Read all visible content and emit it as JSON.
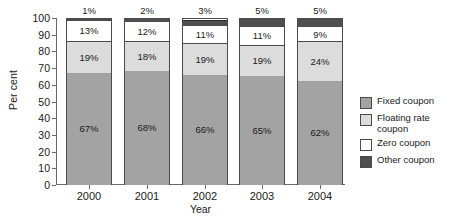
{
  "chart_data": {
    "type": "bar",
    "stacked": true,
    "title": "",
    "xlabel": "Year",
    "ylabel": "Per cent",
    "categories": [
      "2000",
      "2001",
      "2002",
      "2003",
      "2004"
    ],
    "ylim": [
      0,
      100
    ],
    "yticks": [
      0,
      10,
      20,
      30,
      40,
      50,
      60,
      70,
      80,
      90,
      100
    ],
    "ytick_labels": [
      "0",
      "10",
      "20",
      "30",
      "40",
      "50",
      "60",
      "70",
      "80",
      "90",
      "100"
    ],
    "grid": false,
    "legend_position": "right",
    "series": [
      {
        "name": "Fixed coupon",
        "color": "#a3a3a3",
        "values": [
          67,
          68,
          66,
          65,
          62
        ],
        "labels": [
          "67%",
          "68%",
          "66%",
          "65%",
          "62%"
        ]
      },
      {
        "name": "Floating rate coupon",
        "color": "#dcdcdc",
        "values": [
          19,
          18,
          19,
          19,
          24
        ],
        "labels": [
          "19%",
          "18%",
          "19%",
          "19%",
          "24%"
        ]
      },
      {
        "name": "Zero coupon",
        "color": "#ffffff",
        "values": [
          13,
          12,
          11,
          11,
          9
        ],
        "labels": [
          "13%",
          "12%",
          "11%",
          "11%",
          "9%"
        ]
      },
      {
        "name": "Other coupon",
        "color": "#4f4f4f",
        "values": [
          1,
          2,
          3,
          5,
          5
        ],
        "labels": [
          "1%",
          "2%",
          "3%",
          "5%",
          "5%"
        ]
      }
    ],
    "bar_top_labels": [
      "1%",
      "2%",
      "3%",
      "5%",
      "5%"
    ]
  },
  "axes": {
    "y_title": "Per cent",
    "x_title": "Year"
  },
  "legend": {
    "items": [
      {
        "label": "Fixed coupon",
        "color": "#a3a3a3",
        "swatch": "sw-fixed"
      },
      {
        "label": "Floating rate\ncoupon",
        "color": "#dcdcdc",
        "swatch": "sw-floating"
      },
      {
        "label": "Zero coupon",
        "color": "#ffffff",
        "swatch": "sw-zero"
      },
      {
        "label": "Other coupon",
        "color": "#4f4f4f",
        "swatch": "sw-other"
      }
    ]
  }
}
